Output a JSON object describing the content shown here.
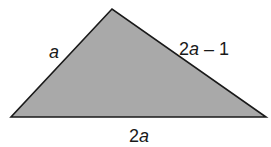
{
  "figure": {
    "type": "triangle",
    "fill_color": "#a9a9a9",
    "stroke_color": "#1a1a1a",
    "vertices": {
      "apex": [
        112,
        9
      ],
      "bottom_left": [
        11,
        117
      ],
      "bottom_right": [
        266,
        117
      ]
    },
    "sides": {
      "left": {
        "coefficient": "",
        "variable": "a",
        "suffix": ""
      },
      "right": {
        "coefficient": "2",
        "variable": "a",
        "suffix": " – 1"
      },
      "base": {
        "coefficient": "2",
        "variable": "a",
        "suffix": ""
      }
    }
  }
}
